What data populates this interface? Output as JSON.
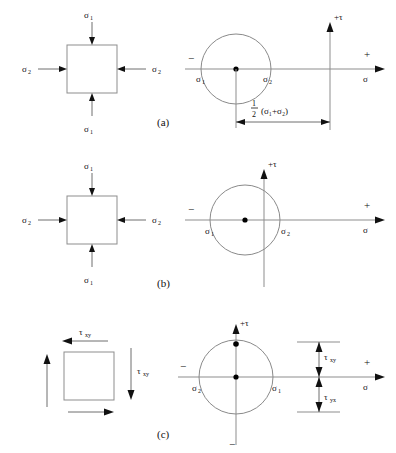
{
  "figure": {
    "line_color": "#8d8d8d",
    "arrow_color": "#111111",
    "background": "#ffffff",
    "sigma": "σ",
    "tau": "τ",
    "plus": "+",
    "minus": "−",
    "sub1": "1",
    "sub2": "2",
    "sub_xy": "xy",
    "sub_yx": "yx"
  },
  "panels": [
    {
      "id": "a",
      "label": "(a)",
      "element": {
        "top_label": "σ",
        "top_sub": "1",
        "bottom_label": "σ",
        "bottom_sub": "1",
        "left_label": "σ",
        "left_sub": "2",
        "right_label": "σ",
        "right_sub": "2",
        "arrow_sense": "inward"
      },
      "mohr": {
        "tau_axis_label": "+τ",
        "sigma_axis_label": "σ",
        "plus_label": "+",
        "minus_label": "−",
        "left_point": "σ",
        "left_point_sub": "1",
        "right_point": "σ",
        "right_point_sub": "2",
        "dimension": {
          "numerator": "1",
          "denominator": "2",
          "expr": "(σ₁+σ₂)"
        },
        "circle_side": "negative",
        "center_dot": true
      }
    },
    {
      "id": "b",
      "label": "(b)",
      "element": {
        "top_label": "σ",
        "top_sub": "1",
        "bottom_label": "σ",
        "bottom_sub": "1",
        "left_label": "σ",
        "left_sub": "2",
        "right_label": "σ",
        "right_sub": "2",
        "arrow_sense": "inward"
      },
      "mohr": {
        "tau_axis_label": "+τ",
        "sigma_axis_label": "σ",
        "plus_label": "+",
        "minus_label": "−",
        "left_point": "σ",
        "left_point_sub": "1",
        "right_point": "σ",
        "right_point_sub": "2",
        "circle_side": "straddling",
        "center_dot": true
      }
    },
    {
      "id": "c",
      "label": "(c)",
      "element": {
        "top_label": "τ",
        "top_sub": "xy",
        "right_label": "τ",
        "right_sub": "xy",
        "arrow_sense": "shear-couple"
      },
      "mohr": {
        "tau_axis_label": "+τ",
        "sigma_axis_label": "σ",
        "plus_label": "+",
        "minus_label": "−",
        "minus_tau_label": "−",
        "left_point": "σ",
        "left_point_sub": "2",
        "right_point": "σ",
        "right_point_sub": "1",
        "circle_side": "centered",
        "center_dot": true,
        "top_dot": true,
        "shear_upper": "τ",
        "shear_upper_sub": "xy",
        "shear_lower": "τ",
        "shear_lower_sub": "yx"
      }
    }
  ]
}
